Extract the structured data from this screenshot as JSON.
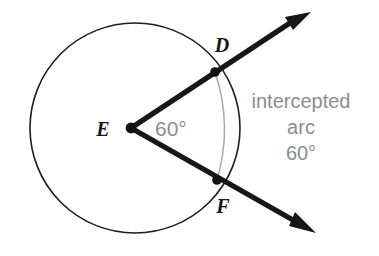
{
  "figure": {
    "type": "circle-central-angle-diagram",
    "background_color": "#ffffff",
    "stroke_color": "#17171a",
    "arc_color": "#a8a8ab",
    "annotation_color": "#8d8d90"
  },
  "labels": {
    "center_point": "E",
    "point_top": "D",
    "point_bottom": "F",
    "angle_measure": "60°"
  },
  "annotation": {
    "line1": "intercepted",
    "line2": "arc",
    "line3": "60°"
  },
  "geometry": {
    "circle": {
      "cx": 135,
      "cy": 128,
      "r": 105
    },
    "vertex": {
      "x": 131,
      "y": 128
    },
    "point_d": {
      "x": 215,
      "y": 72
    },
    "point_f": {
      "x": 217,
      "y": 180
    },
    "arrow_tip_upper": {
      "x": 311,
      "y": 12
    },
    "arrow_tip_lower": {
      "x": 316,
      "y": 233
    },
    "arc_bulge_x": 233
  }
}
